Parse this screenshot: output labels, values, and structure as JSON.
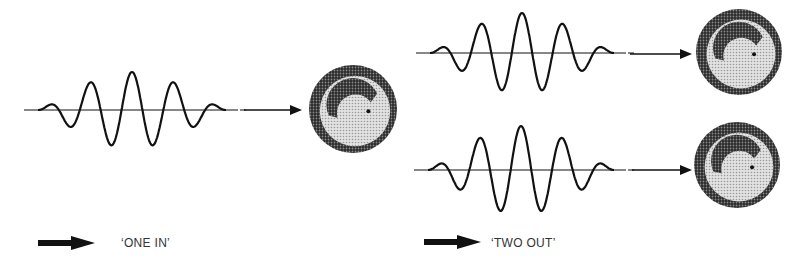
{
  "diagram": {
    "left_panel": {
      "waves": [
        {
          "id": "in",
          "cycles": 5,
          "label": ""
        }
      ],
      "legend": {
        "arrow": "bold-arrow-icon",
        "text": "‘ONE IN’"
      }
    },
    "right_panel": {
      "waves": [
        {
          "id": "out-1",
          "cycles": 5
        },
        {
          "id": "out-2",
          "cycles": 5
        }
      ],
      "legend": {
        "arrow": "bold-arrow-icon",
        "text": "‘TWO OUT’"
      }
    },
    "colors": {
      "ink": "#111111",
      "dish_light": "#cfcfcf",
      "dish_dark": "#3a3a3a"
    }
  }
}
